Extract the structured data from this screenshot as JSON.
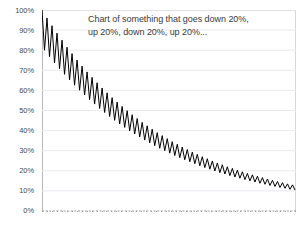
{
  "chart_data": {
    "type": "line",
    "title": "Chart of something that goes down 20%, up 20%, down 20%, up 20%...",
    "title_lines": [
      "Chart of something that goes down 20%,",
      "up 20%, down 20%, up 20%..."
    ],
    "xlabel": "",
    "ylabel": "",
    "ylim": [
      0,
      100
    ],
    "xlim": [
      0,
      102
    ],
    "grid": true,
    "legend": false,
    "series_color": "#000000",
    "grid_color": "#e9e9ef",
    "axis_color": "#b9b9b9",
    "yticks": [
      0,
      10,
      20,
      30,
      40,
      50,
      60,
      70,
      80,
      90,
      100
    ],
    "ytick_labels": [
      "0%",
      "10%",
      "20%",
      "30%",
      "40%",
      "50%",
      "60%",
      "70%",
      "80%",
      "90%",
      "100%"
    ],
    "xtick_count": 51,
    "xtick_labels": [],
    "series": [
      {
        "name": "value",
        "values": [
          100.0,
          80.0,
          96.0,
          76.8,
          92.2,
          73.7,
          88.5,
          70.8,
          85.0,
          68.0,
          81.5,
          65.2,
          78.3,
          62.6,
          75.1,
          60.1,
          72.1,
          57.7,
          69.2,
          55.4,
          66.5,
          53.2,
          63.8,
          51.0,
          61.2,
          49.0,
          58.8,
          47.0,
          56.4,
          45.1,
          54.2,
          43.3,
          52.0,
          41.6,
          49.9,
          39.9,
          47.9,
          38.3,
          46.0,
          36.8,
          44.1,
          35.3,
          42.4,
          33.9,
          40.7,
          32.5,
          39.0,
          31.2,
          37.5,
          30.0,
          36.0,
          28.8,
          34.5,
          27.6,
          33.2,
          26.5,
          31.8,
          25.5,
          30.6,
          24.5,
          29.3,
          23.5,
          28.2,
          22.5,
          27.0,
          21.6,
          26.0,
          20.8,
          24.9,
          19.9,
          23.9,
          19.1,
          23.0,
          18.4,
          22.0,
          17.6,
          21.2,
          16.9,
          20.3,
          16.3,
          19.5,
          15.6,
          18.7,
          15.0,
          18.0,
          14.4,
          17.3,
          13.8,
          16.6,
          13.3,
          15.9,
          12.7,
          15.3,
          12.2,
          14.7,
          11.7,
          14.1,
          11.3,
          13.5,
          10.8,
          13.0,
          10.4
        ]
      }
    ],
    "rendered_envelope": {
      "description": "Visible sawtooth declining from 100% to about 28%",
      "start_value": 100,
      "end_high": 28.8,
      "end_low": 24.0,
      "cycles": 51,
      "down_pct": 20,
      "up_pct": 20
    }
  }
}
